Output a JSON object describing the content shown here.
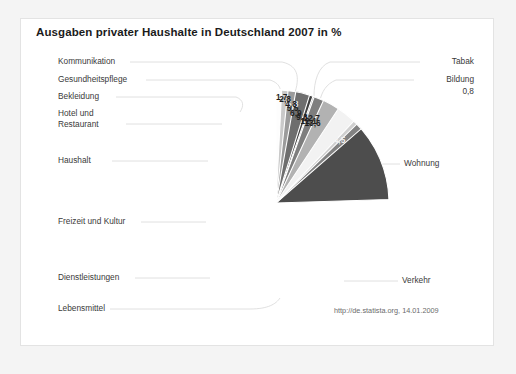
{
  "card": {
    "title": "Ausgaben privater Haushalte in Deutschland 2007 in %",
    "source": "http://de.statista.org, 14.01.2009",
    "background": "#ffffff",
    "page_background": "#f4f4f4",
    "border_color": "#e3e3e3"
  },
  "chart_data": {
    "type": "pie",
    "title": "Ausgaben privater Haushalte in Deutschland 2007 in %",
    "xlabel": "",
    "ylabel": "",
    "unit": "%",
    "decimal_separator": ",",
    "legend": "none",
    "grid": false,
    "start_angle_deg": 0,
    "direction": "clockwise",
    "source": "http://de.statista.org, 14.01.2009",
    "categories": [
      "Wohnung",
      "Verkehr",
      "Lebensmittel",
      "Dienstleistungen",
      "Freizeit und Kultur",
      "Haushalt",
      "Hotel und Restaurant",
      "Bekleidung",
      "Gesundheitspflege",
      "Kommunikation",
      "Tabak",
      "Bildung"
    ],
    "values": [
      24.5,
      13.6,
      12.7,
      12.1,
      9.3,
      6.9,
      5.5,
      5.3,
      4.8,
      2.8,
      1.7,
      0.8
    ],
    "value_labels": [
      "24,5",
      "13,6",
      "12,7",
      "12,1",
      "9,3",
      "6,9",
      "5,5",
      "5,3",
      "4,8",
      "2,8",
      "1,7",
      "0,8"
    ],
    "colors": [
      "#4d4d4d",
      "#828282",
      "#cfcfcf",
      "#f2f2f2",
      "#b2b2b2",
      "#7e7e7e",
      "#a9a9a9",
      "#3f3f3f",
      "#6e6e6e",
      "#9b9b9b",
      "#c9c9c9",
      "#fdfdfd"
    ],
    "slices": [
      {
        "label": "Wohnung",
        "value": 24.5,
        "value_label": "24,5",
        "color": "#4d4d4d",
        "label_side": "right",
        "label_inside": true
      },
      {
        "label": "Verkehr",
        "value": 13.6,
        "value_label": "13,6",
        "color": "#828282",
        "label_side": "right",
        "label_inside": true
      },
      {
        "label": "Lebensmittel",
        "value": 12.7,
        "value_label": "12,7",
        "color": "#cfcfcf",
        "label_side": "bottom",
        "label_inside": true
      },
      {
        "label": "Dienstleistungen",
        "value": 12.1,
        "value_label": "12,1",
        "color": "#f2f2f2",
        "label_side": "left",
        "label_inside": true
      },
      {
        "label": "Freizeit und Kultur",
        "value": 9.3,
        "value_label": "9,3",
        "color": "#b2b2b2",
        "label_side": "left",
        "label_inside": true
      },
      {
        "label": "Haushalt",
        "value": 6.9,
        "value_label": "6,9",
        "color": "#7e7e7e",
        "label_side": "left",
        "label_inside": true
      },
      {
        "label": "Hotel und Restaurant",
        "value": 5.5,
        "value_label": "5,5",
        "color": "#a9a9a9",
        "label_side": "left",
        "label_inside": true
      },
      {
        "label": "Bekleidung",
        "value": 5.3,
        "value_label": "5,3",
        "color": "#3f3f3f",
        "label_side": "left",
        "label_inside": true
      },
      {
        "label": "Gesundheitspflege",
        "value": 4.8,
        "value_label": "4,8",
        "color": "#6e6e6e",
        "label_side": "left",
        "label_inside": true
      },
      {
        "label": "Kommunikation",
        "value": 2.8,
        "value_label": "2,8",
        "color": "#9b9b9b",
        "label_side": "left",
        "label_inside": true
      },
      {
        "label": "Tabak",
        "value": 1.7,
        "value_label": "1,7",
        "color": "#c9c9c9",
        "label_side": "right",
        "label_inside": true
      },
      {
        "label": "Bildung",
        "value": 0.8,
        "value_label": "0,8",
        "color": "#fdfdfd",
        "label_side": "right",
        "label_inside": false
      }
    ]
  },
  "labels": {
    "kommunikation": "Kommunikation",
    "gesundheitspflege": "Gesundheitspflege",
    "bekleidung": "Bekleidung",
    "hotel_line1": "Hotel und",
    "hotel_line2": "Restaurant",
    "haushalt": "Haushalt",
    "freizeit": "Freizeit und Kultur",
    "dienstleistungen": "Dienstleistungen",
    "lebensmittel": "Lebensmittel",
    "tabak": "Tabak",
    "bildung": "Bildung",
    "bildung_value": "0,8",
    "wohnung": "Wohnung",
    "verkehr": "Verkehr"
  }
}
